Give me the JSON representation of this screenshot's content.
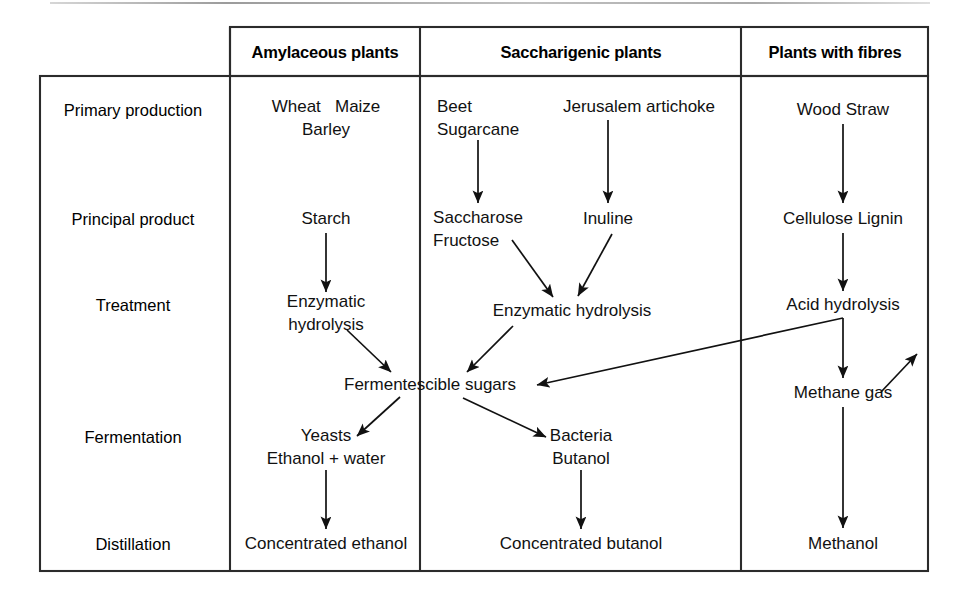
{
  "diagram": {
    "frame": {
      "outer_box": {
        "x": 40,
        "y": 76,
        "w": 888,
        "h": 495
      },
      "header_box": {
        "x": 230,
        "y": 27,
        "w": 698,
        "h": 49
      },
      "dividers_x": [
        230,
        420,
        741
      ]
    },
    "columns": [
      {
        "id": "amylaceous",
        "label": "Amylaceous plants",
        "cx": 325
      },
      {
        "id": "saccharigenic",
        "label": "Saccharigenic plants",
        "cx": 581
      },
      {
        "id": "fibres",
        "label": "Plants with fibres",
        "cx": 835
      }
    ],
    "row_labels": [
      {
        "id": "primary-production",
        "label": "Primary production",
        "cy": 110
      },
      {
        "id": "principal-product",
        "label": "Principal product",
        "cy": 219
      },
      {
        "id": "treatment",
        "label": "Treatment",
        "cy": 305
      },
      {
        "id": "fermentation",
        "label": "Fermentation",
        "cy": 437
      },
      {
        "id": "distillation",
        "label": "Distillation",
        "cy": 544
      }
    ],
    "nodes": [
      {
        "id": "wheat-maize-barley",
        "text": "Wheat   Maize\nBarley",
        "x": 326,
        "y": 118
      },
      {
        "id": "starch",
        "text": "Starch",
        "x": 326,
        "y": 219
      },
      {
        "id": "enzymatic-hydrolysis-starch",
        "text": "Enzymatic\nhydrolysis",
        "x": 326,
        "y": 313
      },
      {
        "id": "yeasts-ethanol-water",
        "text": "Yeasts\nEthanol + water",
        "x": 326,
        "y": 447
      },
      {
        "id": "concentrated-ethanol",
        "text": "Concentrated ethanol",
        "x": 326,
        "y": 544
      },
      {
        "id": "beet-sugarcane",
        "text": "Beet\nSugarcane",
        "x": 478,
        "y": 118
      },
      {
        "id": "jerusalem-artichoke",
        "text": "Jerusalem artichoke",
        "x": 639,
        "y": 107
      },
      {
        "id": "saccharose-fructose",
        "text": "Saccharose\nFructose",
        "x": 478,
        "y": 229
      },
      {
        "id": "inuline",
        "text": "Inuline",
        "x": 608,
        "y": 219
      },
      {
        "id": "enzymatic-hydrolysis-sugar",
        "text": "Enzymatic hydrolysis",
        "x": 572,
        "y": 311
      },
      {
        "id": "fermentescible-sugars",
        "text": "Fermentescible sugars",
        "x": 430,
        "y": 385
      },
      {
        "id": "bacteria-butanol",
        "text": "Bacteria\nButanol",
        "x": 581,
        "y": 447
      },
      {
        "id": "concentrated-butanol",
        "text": "Concentrated butanol",
        "x": 581,
        "y": 544
      },
      {
        "id": "wood-straw",
        "text": "Wood Straw",
        "x": 843,
        "y": 110
      },
      {
        "id": "cellulose-lignin",
        "text": "Cellulose Lignin",
        "x": 843,
        "y": 219
      },
      {
        "id": "acid-hydrolysis",
        "text": "Acid hydrolysis",
        "x": 843,
        "y": 305
      },
      {
        "id": "methane-gas",
        "text": "Methane gas",
        "x": 843,
        "y": 393
      },
      {
        "id": "methanol",
        "text": "Methanol",
        "x": 843,
        "y": 544
      }
    ],
    "edges": [
      {
        "id": "beet-to-saccharose",
        "kind": "arrow",
        "points": "478,140 478,203"
      },
      {
        "id": "artichoke-to-inuline",
        "kind": "arrow",
        "points": "608,120 608,203"
      },
      {
        "id": "starch-to-enzymatic",
        "kind": "arrow",
        "points": "326,233 326,292"
      },
      {
        "id": "woodstraw-to-cellulose",
        "kind": "arrow",
        "points": "843,124 843,203"
      },
      {
        "id": "cellulose-to-acid",
        "kind": "arrow",
        "points": "843,233 843,291"
      },
      {
        "id": "acid-to-methane",
        "kind": "arrow",
        "points": "843,318 843,378"
      },
      {
        "id": "methane-to-methanol",
        "kind": "arrow",
        "points": "843,407 843,528"
      },
      {
        "id": "saccharose-to-enzymatic",
        "kind": "arrow",
        "points": "514,241 553,297"
      },
      {
        "id": "inuline-to-enzymatic",
        "kind": "arrow",
        "points": "611,234 578,296"
      },
      {
        "id": "enzymatic-starch-to-sugars",
        "kind": "arrow",
        "points": "347,330 391,372"
      },
      {
        "id": "enzymatic-sugar-to-sugars",
        "kind": "arrow",
        "points": "513,326 466,372"
      },
      {
        "id": "acid-to-sugars-long",
        "kind": "arrow-elbow",
        "points": "843,318 536,385"
      },
      {
        "id": "sugars-to-yeasts",
        "kind": "arrow",
        "points": "400,397 356,436"
      },
      {
        "id": "sugars-to-bacteria",
        "kind": "arrow",
        "points": "463,397 546,437"
      },
      {
        "id": "yeasts-to-ethanol",
        "kind": "arrow",
        "points": "326,470 326,529"
      },
      {
        "id": "butanol-to-concentrated",
        "kind": "arrow",
        "points": "581,470 581,529"
      },
      {
        "id": "methane-up-right",
        "kind": "arrow",
        "points": "881,392 916,355"
      }
    ]
  }
}
